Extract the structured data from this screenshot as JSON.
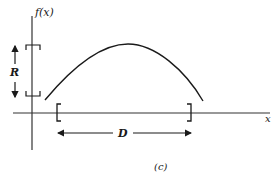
{
  "figure": {
    "caption": "(c)",
    "y_axis_label": "f(x)",
    "x_axis_label": "x",
    "range_label": "R",
    "domain_label": "D",
    "stroke_color": "#1a1a1a",
    "axis_color": "#333333"
  }
}
